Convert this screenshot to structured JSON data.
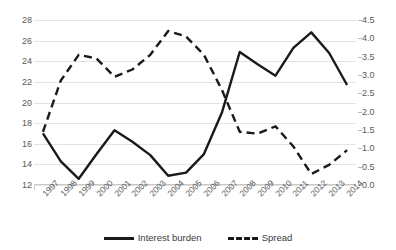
{
  "chart_data": {
    "type": "line",
    "title": "",
    "xlabel": "",
    "ylabel": "",
    "grid": true,
    "legend_position": "bottom",
    "categories": [
      "1997",
      "1998",
      "1999",
      "2000",
      "2001",
      "2002",
      "2003",
      "2004",
      "2005",
      "2006",
      "2007",
      "2008",
      "2009",
      "2010",
      "2011",
      "2012",
      "2013",
      "2014"
    ],
    "axes": {
      "left": {
        "label": "",
        "min": 12,
        "max": 28,
        "step": 2,
        "ticks": [
          "12",
          "14",
          "16",
          "18",
          "20",
          "22",
          "24",
          "26",
          "28"
        ]
      },
      "right": {
        "label": "",
        "min": 0.0,
        "max": 4.5,
        "step": 0.5,
        "ticks": [
          "0.0",
          "0.5",
          "1.0",
          "1.5",
          "2.0",
          "2.5",
          "3.0",
          "3.5",
          "4.0",
          "4.5"
        ]
      }
    },
    "series": [
      {
        "name": "Interest burden",
        "axis": "left",
        "style": "solid",
        "color": "#1a1a1a",
        "values": [
          17.0,
          14.3,
          12.6,
          15.0,
          17.3,
          16.2,
          14.9,
          12.9,
          13.2,
          15.0,
          19.0,
          24.9,
          23.7,
          22.6,
          25.3,
          26.8,
          24.8,
          21.7
        ]
      },
      {
        "name": "Spread",
        "axis": "right",
        "style": "dashed",
        "color": "#1a1a1a",
        "values": [
          1.45,
          2.85,
          3.55,
          3.45,
          2.95,
          3.15,
          3.55,
          4.2,
          4.05,
          3.55,
          2.6,
          1.45,
          1.4,
          1.6,
          1.05,
          0.3,
          0.55,
          0.95
        ]
      }
    ],
    "legend": [
      {
        "label": "Interest burden",
        "style": "solid"
      },
      {
        "label": "Spread",
        "style": "dashed"
      }
    ]
  }
}
